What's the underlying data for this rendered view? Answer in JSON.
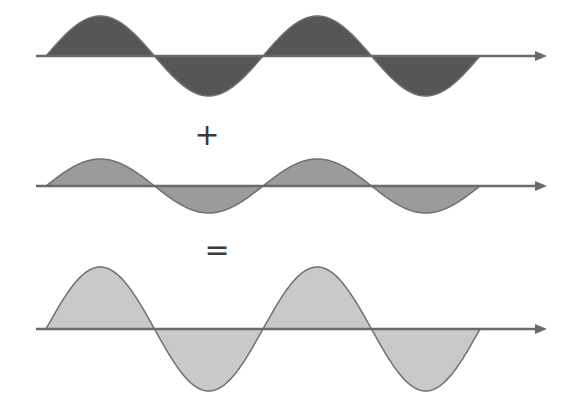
{
  "diagram": {
    "type": "wave_superposition",
    "colors": {
      "background": "#ffffff",
      "axis": "#6a6a6a",
      "outline": "#707070"
    },
    "waves": [
      {
        "name": "wave-1",
        "axis_y": 56,
        "axis_x_start": 36,
        "arrow_tip_x": 547,
        "wave_x_start": 46,
        "wavelength": 217,
        "cycles": 2,
        "amplitude": 40,
        "fill": "#565656"
      },
      {
        "name": "wave-2",
        "axis_y": 186,
        "axis_x_start": 36,
        "arrow_tip_x": 547,
        "wave_x_start": 46,
        "wavelength": 217,
        "cycles": 2,
        "amplitude": 27,
        "fill": "#9b9b9b"
      },
      {
        "name": "resultant-wave",
        "axis_y": 329,
        "axis_x_start": 36,
        "arrow_tip_x": 547,
        "wave_x_start": 46,
        "wavelength": 217,
        "cycles": 2,
        "amplitude": 62,
        "fill": "#c9c9c9"
      }
    ],
    "operators": [
      {
        "name": "plus-sign",
        "symbol": "+",
        "x": 207,
        "y": 135
      },
      {
        "name": "equals-sign",
        "symbol": "=",
        "x": 217,
        "y": 250
      }
    ]
  }
}
